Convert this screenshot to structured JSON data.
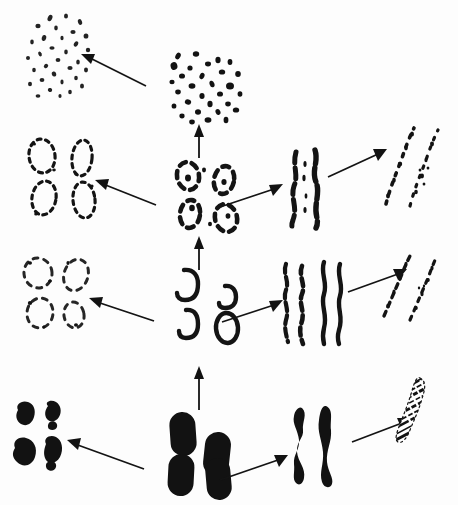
{
  "figure": {
    "background_color": "#fdfdfd",
    "ink_color": "#121212",
    "width": 458,
    "height": 505,
    "columns": [
      "left",
      "center",
      "right",
      "far-right"
    ],
    "rows": 4
  },
  "nodes": [
    {
      "id": "r1-left",
      "label": "Faint dispersed dot cluster",
      "description": "Loose scattered cluster of small faint speckles, two overlapping lobes",
      "row": 1,
      "column": "left",
      "style": "faint-dots",
      "x": 18,
      "y": 8,
      "width": 80,
      "height": 88
    },
    {
      "id": "r1-center",
      "label": "Dense solid dot cluster",
      "description": "Compact field of solid round dots arranged in a square-ish clump",
      "row": 1,
      "column": "center",
      "style": "solid-dots",
      "x": 168,
      "y": 52,
      "width": 78,
      "height": 68
    },
    {
      "id": "r2-left",
      "label": "Four dashed ring outlines",
      "description": "Two-by-two array of broken dashed elliptical outlines",
      "row": 2,
      "column": "left",
      "style": "dashed-rings",
      "x": 20,
      "y": 138,
      "width": 88,
      "height": 80
    },
    {
      "id": "r2-center",
      "label": "Four broken C-shaped rings",
      "description": "Two-by-two array of thick but broken ring forms with gaps and dots",
      "row": 2,
      "column": "center",
      "style": "broken-c-rings",
      "x": 170,
      "y": 160,
      "width": 76,
      "height": 72
    },
    {
      "id": "r2-right",
      "label": "Two beaded vertical strands",
      "description": "Pair of near-vertical irregular beaded chromosome strands",
      "row": 2,
      "column": "right",
      "style": "beaded-strands",
      "x": 285,
      "y": 150,
      "width": 48,
      "height": 78
    },
    {
      "id": "r2-far-right",
      "label": "Two dotted dispersed strands",
      "description": "Pair of tilted strands broken into separated dots and flecks",
      "row": 2,
      "column": "far-right",
      "style": "dotted-strands",
      "x": 378,
      "y": 128,
      "width": 58,
      "height": 78
    },
    {
      "id": "r3-left",
      "label": "Four faint broken rings",
      "description": "Two-by-two array of pale, partially erased ring outlines",
      "row": 3,
      "column": "left",
      "style": "faint-rings",
      "x": 14,
      "y": 255,
      "width": 80,
      "height": 78
    },
    {
      "id": "r3-center",
      "label": "Four hollow outlined rings",
      "description": "Two-by-two array of thick hollow ring / open-loop outlines",
      "row": 3,
      "column": "center",
      "style": "hollow-rings",
      "x": 172,
      "y": 268,
      "width": 72,
      "height": 78
    },
    {
      "id": "r3-right",
      "label": "Two wavy thin strands",
      "description": "Pair of long wavy thin chromosome threads, one beaded one smooth",
      "row": 3,
      "column": "right",
      "style": "wavy-strands",
      "x": 280,
      "y": 262,
      "width": 62,
      "height": 82
    },
    {
      "id": "r3-far-right",
      "label": "Two dashed tilted strands",
      "description": "Pair of tilted strands rendered as dashes and short flecks",
      "row": 3,
      "column": "far-right",
      "style": "dashed-strands",
      "x": 382,
      "y": 258,
      "width": 56,
      "height": 62
    },
    {
      "id": "r4-left",
      "label": "Four rough dark blobs",
      "description": "Two-by-two array of small ragged solid dark masses",
      "row": 4,
      "column": "left",
      "style": "rough-blobs",
      "x": 12,
      "y": 402,
      "width": 62,
      "height": 76
    },
    {
      "id": "r4-center",
      "label": "Four solid condensed chromosomes",
      "description": "Two-by-two array of fully condensed solid black rounded rods",
      "row": 4,
      "column": "center",
      "style": "solid-rods",
      "x": 168,
      "y": 412,
      "width": 70,
      "height": 86
    },
    {
      "id": "r4-right",
      "label": "Two thick solid chromosomes",
      "description": "Pair of thick solid curved chromosome arms",
      "row": 4,
      "column": "right",
      "style": "thick-arms",
      "x": 292,
      "y": 408,
      "width": 48,
      "height": 76
    },
    {
      "id": "r4-far-right",
      "label": "Banded speckled chromosome",
      "description": "Single tilted chromosome with fine granular banding texture",
      "row": 4,
      "column": "far-right",
      "style": "banded-chromosome",
      "x": 392,
      "y": 378,
      "width": 48,
      "height": 64
    }
  ],
  "arrows": [
    {
      "id": "arrow-r1-center-to-left",
      "label": "decondensation arrow row 1",
      "direction": "up-left",
      "x1": 144,
      "y1": 84,
      "x2": 82,
      "y2": 55
    },
    {
      "id": "arrow-r2-to-r1",
      "label": "progression arrow rows 2 to 1",
      "direction": "up",
      "x1": 198,
      "y1": 150,
      "x2": 198,
      "y2": 126
    },
    {
      "id": "arrow-r2-center-to-left",
      "label": "decondensation arrow row 2",
      "direction": "up-left",
      "x1": 152,
      "y1": 203,
      "x2": 98,
      "y2": 182
    },
    {
      "id": "arrow-r2-center-to-right",
      "label": "separation arrow row 2",
      "direction": "up-right",
      "x1": 222,
      "y1": 205,
      "x2": 278,
      "y2": 188
    },
    {
      "id": "arrow-r2-right-to-far",
      "label": "dispersal arrow row 2",
      "direction": "up-right",
      "x1": 328,
      "y1": 176,
      "x2": 382,
      "y2": 152
    },
    {
      "id": "arrow-r3-to-r2",
      "label": "progression arrow rows 3 to 2",
      "direction": "up",
      "x1": 198,
      "y1": 262,
      "x2": 198,
      "y2": 238
    },
    {
      "id": "arrow-r3-center-to-left",
      "label": "decondensation arrow row 3",
      "direction": "up-left",
      "x1": 148,
      "y1": 318,
      "x2": 92,
      "y2": 300
    },
    {
      "id": "arrow-r3-center-to-right",
      "label": "separation arrow row 3",
      "direction": "up-right",
      "x1": 224,
      "y1": 320,
      "x2": 278,
      "y2": 304
    },
    {
      "id": "arrow-r3-right-to-far",
      "label": "dispersal arrow row 3",
      "direction": "up-right",
      "x1": 348,
      "y1": 288,
      "x2": 400,
      "y2": 268
    },
    {
      "id": "arrow-r4-to-r3",
      "label": "progression arrow rows 4 to 3",
      "direction": "up",
      "x1": 198,
      "y1": 404,
      "x2": 198,
      "y2": 368
    },
    {
      "id": "arrow-r4-center-to-left",
      "label": "decondensation arrow row 4",
      "direction": "up-left",
      "x1": 138,
      "y1": 466,
      "x2": 70,
      "y2": 443
    },
    {
      "id": "arrow-r4-center-to-right",
      "label": "separation arrow row 4",
      "direction": "up-right",
      "x1": 222,
      "y1": 478,
      "x2": 282,
      "y2": 458
    },
    {
      "id": "arrow-r4-right-to-far",
      "label": "banding arrow row 4",
      "direction": "up-right",
      "x1": 352,
      "y1": 440,
      "x2": 404,
      "y2": 418
    }
  ]
}
